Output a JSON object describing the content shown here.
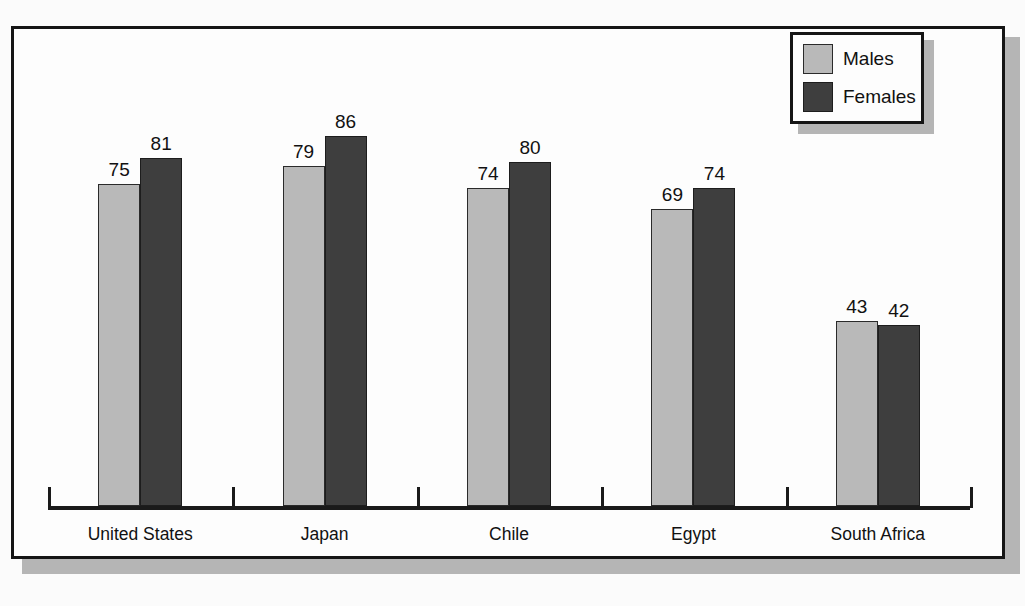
{
  "chart_data": {
    "type": "bar",
    "title": "",
    "subtitle": "",
    "xlabel": "",
    "ylabel": "",
    "categories": [
      "United States",
      "Japan",
      "Chile",
      "Egypt",
      "South Africa"
    ],
    "series": [
      {
        "name": "Males",
        "color": "#b9b9b9",
        "values": [
          75,
          79,
          74,
          69,
          43
        ]
      },
      {
        "name": "Females",
        "color": "#3e3e3e",
        "values": [
          81,
          86,
          80,
          74,
          42
        ]
      }
    ],
    "ylim": [
      0,
      110
    ],
    "grid": false,
    "data_labels": true,
    "legend_position": "top-right",
    "axis_ticks": "category-boundaries",
    "y_axis_visible": false
  },
  "legend": {
    "entries": [
      {
        "label": "Males",
        "swatch": "males-swatch"
      },
      {
        "label": "Females",
        "swatch": "females-swatch"
      }
    ]
  },
  "colors": {
    "males": "#b9b9b9",
    "females": "#3e3e3e",
    "frame": "#151515",
    "shadow": "#b5b5b5",
    "background": "#fbfbfb",
    "text": "#111111"
  }
}
